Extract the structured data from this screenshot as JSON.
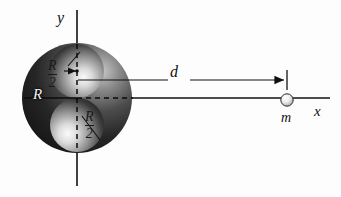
{
  "figure": {
    "background_color": "#fdfdfd",
    "ink_color": "#111111"
  },
  "axes": {
    "y_label": "y",
    "x_label": "x",
    "origin": {
      "x": 77,
      "y": 98
    }
  },
  "body": {
    "radius_label": "R",
    "radius_value_px": 55,
    "center": {
      "x": 77,
      "y": 98
    },
    "fill_color": "#2b2b2b",
    "highlight_color": "#e8e8e8"
  },
  "cavities": [
    {
      "name": "upper-cavity",
      "radius_numerator": "R",
      "radius_denominator": "2",
      "center": {
        "x": 77,
        "y": 71
      },
      "radius_px": 27
    },
    {
      "name": "lower-cavity",
      "radius_numerator": "R",
      "radius_denominator": "2",
      "center": {
        "x": 77,
        "y": 125
      },
      "radius_px": 27
    }
  ],
  "distance": {
    "label": "d",
    "from_x": 77,
    "to_x": 287,
    "line_y": 80
  },
  "point_mass": {
    "label": "m",
    "center": {
      "x": 287,
      "y": 100
    },
    "radius_px": 6,
    "fill_color": "#f0f0f0"
  }
}
